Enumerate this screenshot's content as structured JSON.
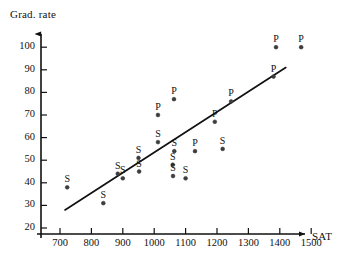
{
  "chart_data": {
    "type": "scatter",
    "title": "",
    "xlabel": "SAT",
    "ylabel": "Grad. rate",
    "xlim": [
      670,
      1530
    ],
    "ylim": [
      20,
      105
    ],
    "grid": false,
    "legend": "none",
    "xticks": [
      700,
      800,
      900,
      1000,
      1100,
      1200,
      1300,
      1400,
      1500
    ],
    "yticks": [
      20,
      30,
      40,
      50,
      60,
      70,
      80,
      90,
      100
    ],
    "xtick_labels": [
      "700",
      "800",
      "900",
      "1000",
      "1100",
      "1200",
      "1300",
      "1400",
      "1500"
    ],
    "ytick_labels": [
      "20",
      "30",
      "40",
      "50",
      "60",
      "70",
      "80",
      "90",
      "100"
    ],
    "point_label_names": [
      "S",
      "P"
    ],
    "series": [
      {
        "name": "S",
        "marker_label": "S",
        "color": "#3c3c3c",
        "points": [
          {
            "x": 723,
            "y": 38,
            "label": "S"
          },
          {
            "x": 838,
            "y": 31,
            "label": "S"
          },
          {
            "x": 884,
            "y": 44,
            "label": "S"
          },
          {
            "x": 900,
            "y": 42,
            "label": "S"
          },
          {
            "x": 950,
            "y": 51,
            "label": "S"
          },
          {
            "x": 952,
            "y": 45,
            "label": "S"
          },
          {
            "x": 1012,
            "y": 58,
            "label": "S"
          },
          {
            "x": 1059,
            "y": 48,
            "label": "S"
          },
          {
            "x": 1060,
            "y": 43,
            "label": "S"
          },
          {
            "x": 1064,
            "y": 54,
            "label": "S"
          },
          {
            "x": 1100,
            "y": 42,
            "label": "S"
          },
          {
            "x": 1218,
            "y": 55,
            "label": "S"
          }
        ]
      },
      {
        "name": "P",
        "marker_label": "P",
        "color": "#3c3c3c",
        "points": [
          {
            "x": 1012,
            "y": 70,
            "label": "P"
          },
          {
            "x": 1063,
            "y": 77,
            "label": "P"
          },
          {
            "x": 1130,
            "y": 54,
            "label": "P"
          },
          {
            "x": 1193,
            "y": 67,
            "label": "P"
          },
          {
            "x": 1245,
            "y": 76,
            "label": "P"
          },
          {
            "x": 1380,
            "y": 87,
            "label": "P"
          },
          {
            "x": 1388,
            "y": 100,
            "label": "P"
          },
          {
            "x": 1468,
            "y": 100,
            "label": "P"
          }
        ]
      }
    ],
    "regression_line": {
      "name": "fitted line",
      "x_start": 716,
      "y_start": 28,
      "x_end": 1419,
      "y_end": 91,
      "color": "#111111"
    }
  }
}
